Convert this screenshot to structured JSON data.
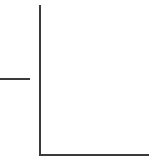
{
  "diagram": {
    "line_color": "#3a3a3a",
    "background": "#ffffff",
    "elements": [
      {
        "name": "vertical-axis-line",
        "x": 39,
        "y1": 5,
        "y2": 156
      },
      {
        "name": "horizontal-axis-line",
        "y": 155,
        "x1": 39,
        "x2": 149
      },
      {
        "name": "left-stub-line",
        "y": 79,
        "x1": 0,
        "x2": 30
      }
    ]
  }
}
